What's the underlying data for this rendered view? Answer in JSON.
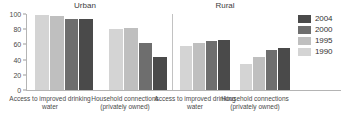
{
  "chart_data": {
    "type": "bar",
    "title": "",
    "xlabel": "",
    "ylabel": "",
    "ylim": [
      0,
      100
    ],
    "yticks": [
      0,
      20,
      40,
      60,
      80,
      100
    ],
    "grid": false,
    "legend_position": "right",
    "legend_entries": [
      "2004",
      "2000",
      "1995",
      "1990"
    ],
    "panels": [
      {
        "name": "Urban",
        "categories": [
          "Access to improved drinking water",
          "Household connections (privately owned)"
        ],
        "series": [
          {
            "name": "1990",
            "values": [
              99,
              80
            ]
          },
          {
            "name": "1995",
            "values": [
              98,
              82
            ]
          },
          {
            "name": "2000",
            "values": [
              94,
              62
            ]
          },
          {
            "name": "2004",
            "values": [
              93,
              44
            ]
          }
        ]
      },
      {
        "name": "Rural",
        "categories": [
          "Access to improved drinking water",
          "Household connections (privately owned)"
        ],
        "series": [
          {
            "name": "1990",
            "values": [
              58,
              34
            ]
          },
          {
            "name": "1995",
            "values": [
              62,
              43
            ]
          },
          {
            "name": "2000",
            "values": [
              64,
              52
            ]
          },
          {
            "name": "2004",
            "values": [
              66,
              55
            ]
          }
        ]
      }
    ],
    "colors": {
      "1990": "#d4d4d4",
      "1995": "#bfbfbf",
      "2000": "#6e6e6e",
      "2004": "#4a4a4a",
      "axis": "#b4b4b4",
      "text": "#3c3c3c"
    }
  },
  "panel_titles": {
    "urban": "Urban",
    "rural": "Rural"
  },
  "x_labels": {
    "access": "Access to improved drinking water",
    "household": "Household connections (privately owned)"
  },
  "y_tick_labels": [
    "100",
    "80",
    "60",
    "40",
    "20",
    "0"
  ],
  "legend": {
    "items": [
      {
        "label": "2004",
        "color": "#4a4a4a"
      },
      {
        "label": "2000",
        "color": "#6e6e6e"
      },
      {
        "label": "1995",
        "color": "#bfbfbf"
      },
      {
        "label": "1990",
        "color": "#d4d4d4"
      }
    ]
  }
}
